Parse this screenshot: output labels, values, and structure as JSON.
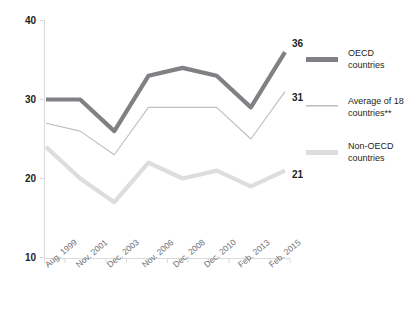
{
  "chart_data": {
    "type": "line",
    "title": "",
    "xlabel": "",
    "ylabel": "",
    "ylim": [
      10,
      40
    ],
    "yticks": [
      10,
      20,
      30,
      40
    ],
    "ytick_labels": [
      "10",
      "20",
      "30",
      "40"
    ],
    "grid": false,
    "legend_position": "right",
    "categories": [
      "Aug. 1999",
      "Nov. 2001",
      "Dec. 2003",
      "Nov. 2006",
      "Dec. 2008",
      "Dec. 2010",
      "Feb. 2013",
      "Feb. 2015"
    ],
    "series": [
      {
        "name": "OECD countries",
        "values": [
          30,
          30,
          26,
          33,
          34,
          33,
          29,
          36
        ],
        "color": "#808184",
        "width": 4.2,
        "end_label": "36"
      },
      {
        "name": "Average of 18 countries**",
        "values": [
          27,
          26,
          23,
          29,
          29,
          29,
          25,
          31
        ],
        "color": "#bcbec0",
        "width": 1.1,
        "end_label": "31"
      },
      {
        "name": "Non-OECD countries",
        "values": [
          24,
          20,
          17,
          22,
          20,
          21,
          19,
          21
        ],
        "color": "#dcdddf",
        "width": 4.2,
        "end_label": "21"
      }
    ]
  },
  "axes": {
    "y_labels": [
      "40",
      "30",
      "20",
      "10"
    ],
    "x_labels": [
      "Aug. 1999",
      "Nov. 2001",
      "Dec. 2003",
      "Nov. 2006",
      "Dec. 2008",
      "Dec. 2010",
      "Feb. 2013",
      "Feb. 2015"
    ]
  },
  "end_labels": {
    "oecd": "36",
    "average": "31",
    "non_oecd": "21"
  },
  "legend": {
    "items": [
      {
        "line1": "OECD",
        "line2": "countries",
        "swatch": "#808184",
        "thickness": 5
      },
      {
        "line1": "Average of 18",
        "line2": "countries**",
        "swatch": "#bcbec0",
        "thickness": 1.5
      },
      {
        "line1": "Non-OECD",
        "line2": "countries",
        "swatch": "#dcdddf",
        "thickness": 5
      }
    ]
  },
  "colors": {
    "oecd": "#808184",
    "average": "#bcbec0",
    "non_oecd": "#dcdddf",
    "axis": "#d9d9d9",
    "text": "#231f20",
    "xtick_text": "#6d6e71"
  }
}
